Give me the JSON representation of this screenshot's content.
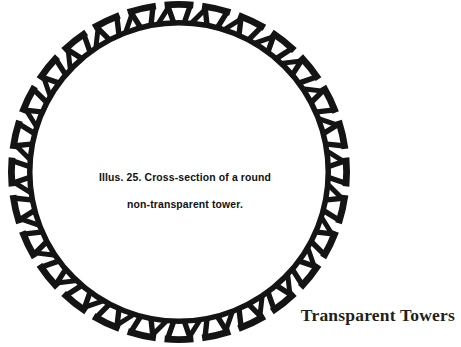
{
  "page": {
    "width": 461,
    "height": 347,
    "background_color": "#ffffff",
    "ink_color": "#141414"
  },
  "figure": {
    "name": "round-non-transparent-tower-cross-section",
    "caption_line_1": "Illus. 25. Cross-section of a round",
    "caption_line_2": "non-transparent tower.",
    "caption_full": "Illus. 25. Cross-section of a round non-transparent tower.",
    "illustration_number": "25",
    "geometry": {
      "center_x": 179,
      "center_y": 172,
      "outer_radius": 171,
      "outer_band_inner_radius": 158,
      "inner_ring_outer_radius": 152,
      "inner_ring_inner_radius": 146.5,
      "segment_count": 28,
      "segment_span_degrees": 12.857,
      "segment_gap_degrees": 3.0,
      "strut_width": 5.4,
      "outer_arc_width": 6.8,
      "inner_ring_width": 5.5
    }
  },
  "plate": {
    "label": "Transparent Towers"
  }
}
